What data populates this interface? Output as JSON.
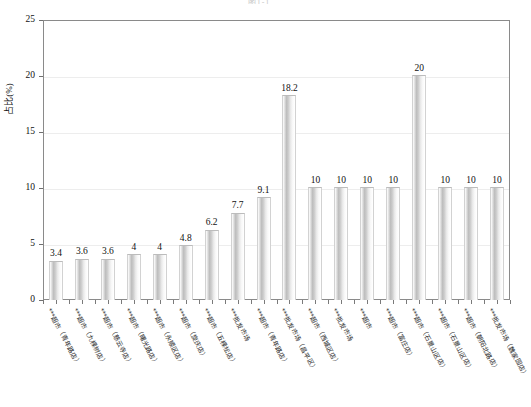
{
  "chart_data": {
    "type": "bar",
    "title": "图1-1",
    "xlabel": "",
    "ylabel": "占比(%)",
    "ylim": [
      0,
      25
    ],
    "yticks": [
      0,
      5,
      10,
      15,
      20,
      25
    ],
    "grid": true,
    "legend": "none",
    "categories": [
      "***超市（青年路店）",
      "***超市（九棵树店）",
      "***超市（慈云寺店）",
      "***超市（曙光路店）",
      "***超市（永顺区店）",
      "***超市（旋庆店）",
      "***超市（五棵松店）",
      "***批发市场",
      "***超市（青年路店）",
      "***批发市场（昌平区）",
      "***超市（西城区店）",
      "***批发市场",
      "***超市",
      "***超市（富庄店）",
      "***超市（石景山区店）",
      "***超市（石景山区店）",
      "***超市（朝阳北路店）",
      "***批发市场（魏家园店）"
    ],
    "values": [
      3.4,
      3.6,
      3.6,
      4,
      4,
      4.8,
      6.2,
      7.7,
      9.1,
      18.2,
      10,
      10,
      10,
      10,
      20,
      10,
      10,
      10
    ],
    "value_labels": [
      "3.4",
      "3.6",
      "3.6",
      "4",
      "4",
      "4.8",
      "6.2",
      "7.7",
      "9.1",
      "18.2",
      "10",
      "10",
      "10",
      "10",
      "20",
      "10",
      "10",
      "10"
    ],
    "ytick_labels": [
      "0",
      "5",
      "10",
      "15",
      "20",
      "25"
    ],
    "colors": {
      "bar_light": "#ffffff",
      "bar_mid": "#bdbdbd",
      "axis": "#8a8a8a",
      "grid": "#ededed",
      "text": "#111111"
    }
  }
}
